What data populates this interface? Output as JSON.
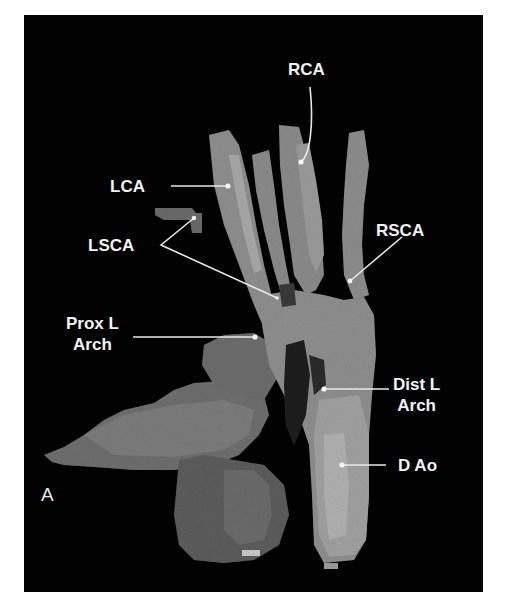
{
  "figure": {
    "panel_letter": "A",
    "background_color": "#020202",
    "tissue_color": "#8a8a8a",
    "label_color": "#f2f2f2",
    "labels": {
      "rca": "RCA",
      "lca": "LCA",
      "lsca": "LSCA",
      "rsca": "RSCA",
      "prox_l_arch_line1": "Prox L",
      "prox_l_arch_line2": "Arch",
      "dist_l_arch_line1": "Dist L",
      "dist_l_arch_line2": "Arch",
      "d_ao": "D Ao"
    }
  }
}
